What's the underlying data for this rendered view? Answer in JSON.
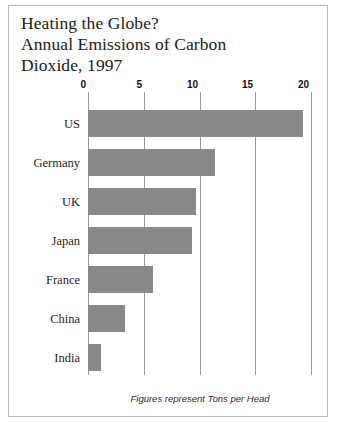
{
  "frame": {
    "border_color": "#b9b9b9"
  },
  "title": {
    "line1": "Heating the Globe?",
    "line2": "Annual Emissions of Carbon",
    "line3": "Dioxide, 1997"
  },
  "footnote": "Figures represent Tons per Head",
  "colors": {
    "bar_fill": "#888888",
    "gridline": "#9a9a9a",
    "text": "#1a1a1a"
  },
  "chart_data": {
    "type": "bar",
    "orientation": "horizontal",
    "title": "Heating the Globe? Annual Emissions of Carbon Dioxide, 1997",
    "subtitle": "Figures represent Tons per Head",
    "xlabel": "",
    "ylabel": "",
    "categories": [
      "US",
      "Germany",
      "UK",
      "Japan",
      "France",
      "China",
      "India"
    ],
    "values": [
      19.3,
      11.4,
      9.7,
      9.3,
      5.8,
      3.3,
      1.2
    ],
    "units": "Tons per Head",
    "xlim": [
      0,
      20
    ],
    "xticks": [
      0,
      5,
      10,
      15,
      20
    ],
    "xticklabels": [
      "0",
      "5",
      "10",
      "15",
      "20"
    ],
    "grid": true,
    "grid_axis": "x",
    "legend": false
  }
}
